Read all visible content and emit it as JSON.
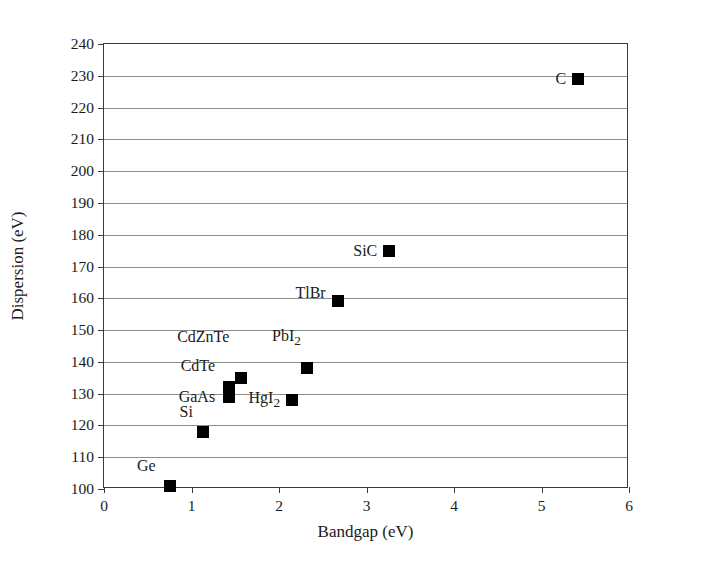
{
  "chart_data": {
    "type": "scatter",
    "title": "",
    "xlabel": "Bandgap (eV)",
    "ylabel": "Dispersion (eV)",
    "xlim": [
      0,
      6
    ],
    "ylim": [
      100,
      240
    ],
    "xticks": [
      0,
      1,
      2,
      3,
      4,
      5,
      6
    ],
    "yticks": [
      100,
      110,
      120,
      130,
      140,
      150,
      160,
      170,
      180,
      190,
      200,
      210,
      220,
      230,
      240
    ],
    "xtick_labels": [
      "0",
      "1",
      "2",
      "3",
      "4",
      "5",
      "6"
    ],
    "ytick_labels": [
      "100",
      "110",
      "120",
      "130",
      "140",
      "150",
      "160",
      "170",
      "180",
      "190",
      "200",
      "210",
      "220",
      "230",
      "240"
    ],
    "grid": "horizontal",
    "legend": "none",
    "marker_color": "#000000",
    "marker_shape": "square",
    "points": [
      {
        "label": "Ge",
        "x": 0.75,
        "y": 101,
        "label_dx": -14,
        "label_dy": -20
      },
      {
        "label": "Si",
        "x": 1.13,
        "y": 118,
        "label_dx": -10,
        "label_dy": -20
      },
      {
        "label": "GaAs",
        "x": 1.43,
        "y": 129,
        "label_dx": -14,
        "label_dy": 0
      },
      {
        "label": "CdTe",
        "x": 1.43,
        "y": 132,
        "label_dx": -14,
        "label_dy": -21
      },
      {
        "label": "CdZnTe",
        "x": 1.57,
        "y": 135,
        "label_dx": -12,
        "label_dy": -41
      },
      {
        "label": "HgI2",
        "x": 2.15,
        "y": 128,
        "label_dx": -12,
        "label_dy": 0
      },
      {
        "label": "PbI2",
        "x": 2.32,
        "y": 138,
        "label_dx": -6,
        "label_dy": -30
      },
      {
        "label": "TlBr",
        "x": 2.67,
        "y": 159,
        "label_dx": -12,
        "label_dy": -8
      },
      {
        "label": "SiC",
        "x": 3.26,
        "y": 175,
        "label_dx": -12,
        "label_dy": 0
      },
      {
        "label": "C",
        "x": 5.42,
        "y": 229,
        "label_dx": -12,
        "label_dy": 0
      }
    ]
  }
}
